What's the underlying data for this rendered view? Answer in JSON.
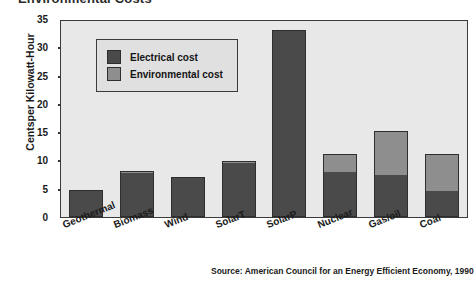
{
  "figure": {
    "title_cropped": "Environmental Costs",
    "source_note": "Source: American Council for an Energy Efficient Economy, 1990"
  },
  "legend": {
    "items": [
      {
        "label": "Electrical cost",
        "color": "#4a4a4a"
      },
      {
        "label": "Environmental cost",
        "color": "#8e8e8e"
      }
    ]
  },
  "axis": {
    "ylabel": "Centsper Kilowatt-Hour",
    "yticks": [
      "35",
      "30",
      "25",
      "20",
      "15",
      "10",
      "5",
      "0"
    ]
  },
  "chart_data": {
    "type": "bar",
    "stacked": true,
    "title": "Environmental Costs",
    "xlabel": "",
    "ylabel": "Centsper Kilowatt-Hour",
    "ylim": [
      0,
      35
    ],
    "ytick_values": [
      0,
      5,
      10,
      15,
      20,
      25,
      30,
      35
    ],
    "grid": false,
    "legend_position": "upper-left-inside",
    "categories": [
      "Geothermal",
      "Biomass",
      "Wind",
      "SolarT",
      "SolarP",
      "Nuclear",
      "Gas/oil",
      "Coal"
    ],
    "series": [
      {
        "name": "Electrical cost",
        "color": "#4a4a4a",
        "values": [
          4.7,
          7.7,
          7.0,
          9.5,
          33.0,
          8.0,
          7.4,
          4.6
        ]
      },
      {
        "name": "Environmental cost",
        "color": "#8e8e8e",
        "values": [
          0.0,
          0.5,
          0.0,
          0.4,
          0.0,
          3.1,
          7.8,
          6.6
        ]
      }
    ],
    "totals": [
      4.7,
      8.2,
      7.0,
      9.9,
      33.0,
      11.1,
      15.2,
      11.2
    ],
    "source": "Source: American Council for an Energy Efficient Economy, 1990"
  }
}
